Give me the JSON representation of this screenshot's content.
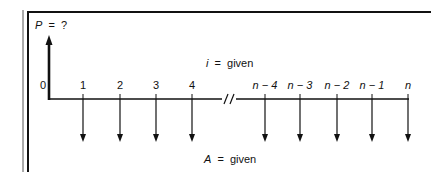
{
  "diagram": {
    "type": "cash-flow-diagram",
    "present_value_label": {
      "var": "P",
      "eq": "=",
      "value": "?"
    },
    "interest_label": {
      "var": "i",
      "eq": "=",
      "value": "given"
    },
    "annuity_label": {
      "var": "A",
      "eq": "=",
      "value": "given"
    },
    "periods": [
      {
        "label": "0",
        "x": 48
      },
      {
        "label": "1",
        "x": 83
      },
      {
        "label": "2",
        "x": 120
      },
      {
        "label": "3",
        "x": 156
      },
      {
        "label": "4",
        "x": 192
      },
      {
        "label": "n − 4",
        "x": 265
      },
      {
        "label": "n − 3",
        "x": 300
      },
      {
        "label": "n − 2",
        "x": 337
      },
      {
        "label": "n − 1",
        "x": 372
      },
      {
        "label": "n",
        "x": 408
      }
    ],
    "break_mark": "//",
    "colors": {
      "line": "#111111",
      "background": "#ffffff"
    }
  }
}
